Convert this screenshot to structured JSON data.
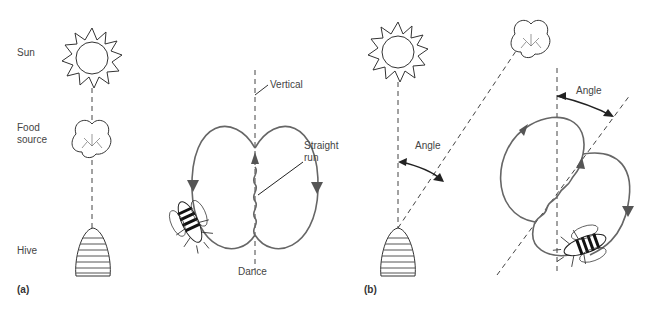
{
  "panel_a": {
    "tag": "(a)",
    "labels": {
      "sun": "Sun",
      "food_source_1": "Food",
      "food_source_2": "source",
      "hive": "Hive",
      "vertical": "Vertical",
      "straight_run_1": "Straight",
      "straight_run_2": "run",
      "dance": "Dance"
    }
  },
  "panel_b": {
    "tag": "(b)",
    "labels": {
      "angle_left": "Angle",
      "angle_right": "Angle"
    }
  },
  "caption_partial": "FIGURE 11",
  "colors": {
    "dance_loop": "#666666",
    "line": "#444444"
  }
}
